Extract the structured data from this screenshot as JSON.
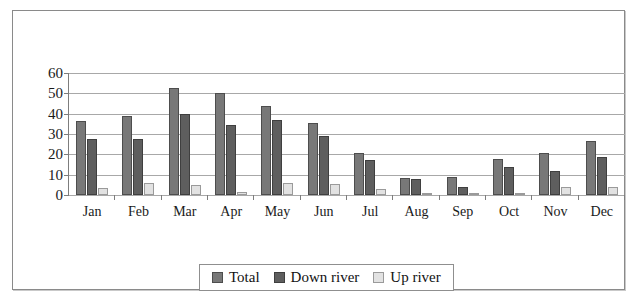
{
  "figure": {
    "title": "",
    "legend_position": "bottom-center",
    "grid": true
  },
  "chart_data": {
    "type": "bar",
    "title": "",
    "xlabel": "",
    "ylabel": "",
    "ylim": [
      0,
      60
    ],
    "yticks": [
      0,
      10,
      20,
      30,
      40,
      50,
      60
    ],
    "grid": true,
    "legend_position": "bottom-center",
    "categories": [
      "Jan",
      "Feb",
      "Mar",
      "Apr",
      "May",
      "Jun",
      "Jul",
      "Aug",
      "Sep",
      "Oct",
      "Nov",
      "Dec"
    ],
    "series": [
      {
        "name": "Total",
        "color": "#787878",
        "values": [
          36.5,
          39.0,
          52.5,
          50.0,
          44.0,
          35.5,
          20.5,
          8.5,
          9.0,
          17.5,
          20.5,
          26.5
        ]
      },
      {
        "name": "Down river",
        "color": "#5e5e5e",
        "values": [
          27.5,
          27.5,
          40.0,
          34.5,
          37.0,
          29.0,
          17.0,
          8.0,
          4.0,
          14.0,
          12.0,
          18.5
        ]
      },
      {
        "name": "Up river",
        "color": "#e2e2e2",
        "values": [
          3.5,
          6.0,
          5.0,
          1.5,
          6.0,
          5.5,
          3.0,
          0.5,
          1.0,
          0.5,
          4.0,
          4.0
        ]
      }
    ]
  }
}
